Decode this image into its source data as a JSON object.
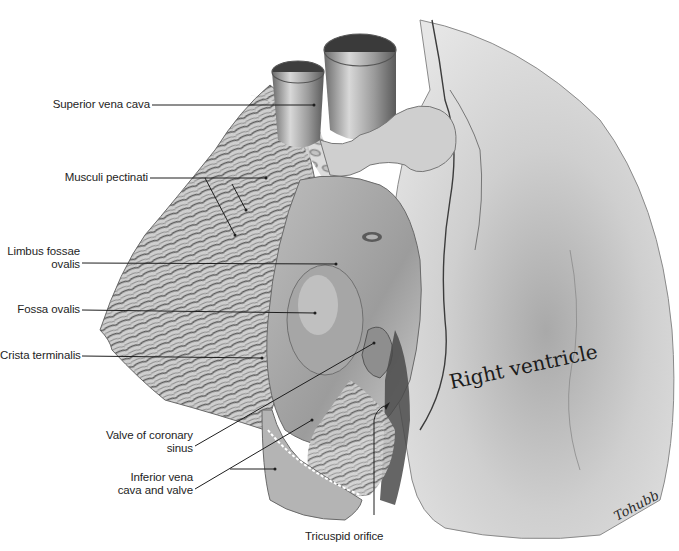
{
  "figure": {
    "region_label": "Right ventricle",
    "signature": "Tohubb",
    "labels": [
      {
        "id": "superior-vena-cava",
        "lines": [
          "Superior vena cava"
        ]
      },
      {
        "id": "musculi-pectinati",
        "lines": [
          "Musculi pectinati"
        ]
      },
      {
        "id": "limbus-fossae-ovalis",
        "lines": [
          "Limbus fossae",
          "ovalis"
        ]
      },
      {
        "id": "fossa-ovalis",
        "lines": [
          "Fossa ovalis"
        ]
      },
      {
        "id": "crista-terminalis",
        "lines": [
          "Crista terminalis"
        ]
      },
      {
        "id": "valve-of-coronary-sinus",
        "lines": [
          "Valve of coronary",
          "sinus"
        ]
      },
      {
        "id": "inferior-vena-cava-and-valve",
        "lines": [
          "Inferior vena",
          "cava and valve"
        ]
      },
      {
        "id": "tricuspid-orifice",
        "lines": [
          "Tricuspid orifice"
        ]
      }
    ]
  }
}
